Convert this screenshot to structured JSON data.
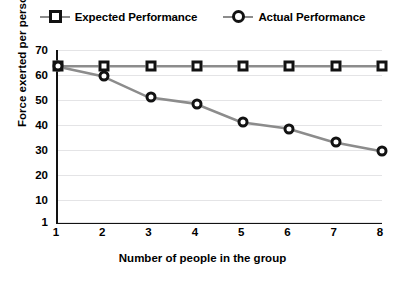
{
  "chart_data": {
    "type": "line",
    "title": "",
    "xlabel": "Number of people in the group",
    "ylabel": "Force exerted per person",
    "x": [
      1,
      2,
      3,
      4,
      5,
      6,
      7,
      8
    ],
    "xticklabels": [
      "1",
      "2",
      "3",
      "4",
      "5",
      "6",
      "7",
      "8"
    ],
    "yticks": [
      1,
      10,
      20,
      30,
      40,
      50,
      60,
      70
    ],
    "yticklabels": [
      "1",
      "10",
      "20",
      "30",
      "40",
      "50",
      "60",
      "70"
    ],
    "xlim": [
      1,
      8
    ],
    "ylim": [
      1,
      70
    ],
    "grid": true,
    "grid_axis": "y",
    "legend_position": "top-center",
    "series": [
      {
        "name": "Expected Performance",
        "marker": "square",
        "values": [
          63.5,
          63.5,
          63.5,
          63.5,
          63.5,
          63.5,
          63.5,
          63.5
        ]
      },
      {
        "name": "Actual Performance",
        "marker": "circle",
        "values": [
          63.5,
          59.5,
          51,
          48.5,
          41,
          38.5,
          33,
          29.5
        ]
      }
    ]
  },
  "colors": {
    "line": "#8c8c8c",
    "marker_edge": "#121212",
    "marker_fill": "#ffffff",
    "axis": "#121212",
    "grid": "#e4e4e6",
    "background": "#ffffff"
  }
}
